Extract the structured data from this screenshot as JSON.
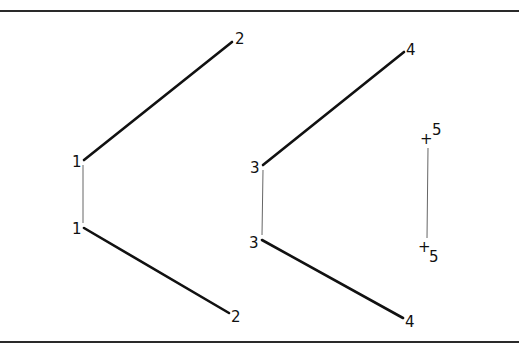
{
  "diagram": {
    "colors": {
      "line": "#111111",
      "thin_line": "#666666",
      "rule": "#2a2a2a",
      "background": "#ffffff"
    },
    "frame": {
      "top_rule_y": 10,
      "bottom_rule_y": 341
    },
    "groups": [
      {
        "id": "group-1",
        "label_upper": "1",
        "label_lower": "1",
        "end_label_upper": "2",
        "end_label_lower": "2"
      },
      {
        "id": "group-2",
        "label_upper": "3",
        "label_lower": "3",
        "end_label_upper": "4",
        "end_label_lower": "4"
      },
      {
        "id": "group-3",
        "marker_upper": "+",
        "marker_lower": "+",
        "label_upper": "5",
        "label_lower": "5"
      }
    ]
  }
}
